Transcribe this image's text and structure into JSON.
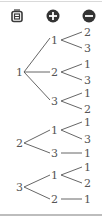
{
  "toolbar": {
    "buttons": [
      {
        "name": "image-frame-icon",
        "label": ""
      },
      {
        "name": "zoom-in-icon",
        "label": "+"
      },
      {
        "name": "zoom-out-icon",
        "label": "−"
      }
    ]
  },
  "tree": {
    "roots": [
      {
        "label": "1",
        "children": [
          {
            "label": "1",
            "children": [
              "2",
              "3"
            ]
          },
          {
            "label": "2",
            "children": [
              "1",
              "3"
            ]
          },
          {
            "label": "3",
            "children": [
              "1",
              "2"
            ]
          }
        ]
      },
      {
        "label": "2",
        "children": [
          {
            "label": "1",
            "children": [
              "1",
              "3"
            ]
          },
          {
            "label": "3",
            "children": [
              "1"
            ]
          }
        ]
      },
      {
        "label": "3",
        "children": [
          {
            "label": "1",
            "children": [
              "1",
              "2"
            ]
          },
          {
            "label": "2",
            "children": [
              "1"
            ]
          }
        ]
      }
    ]
  },
  "colors": {
    "stroke": "#555555",
    "icon": "#3a3a3a"
  }
}
